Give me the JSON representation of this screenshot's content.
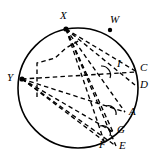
{
  "figure": {
    "type": "geometry-diagram",
    "background_color": "#ffffff",
    "stroke_color": "#000000",
    "circle": {
      "center_x": 78,
      "center_y": 88,
      "radius": 60,
      "solid_arc": true
    },
    "vertices": [
      {
        "id": "X",
        "label": "X",
        "x": 66,
        "y": 29,
        "label_x": 60,
        "label_y": 10,
        "dot": true
      },
      {
        "id": "Y",
        "label": "Y",
        "x": 22,
        "y": 79,
        "label_x": 7,
        "label_y": 72,
        "dot": true
      }
    ],
    "points": [
      {
        "id": "W",
        "label": "W",
        "x": 110,
        "y": 30,
        "label_x": 110,
        "label_y": 14,
        "dot": true
      },
      {
        "id": "C",
        "label": "C",
        "x": 137,
        "y": 72,
        "label_x": 140,
        "label_y": 62,
        "dot": false
      },
      {
        "id": "D",
        "label": "D",
        "x": 135,
        "y": 85,
        "label_x": 140,
        "label_y": 79,
        "dot": false
      },
      {
        "id": "A",
        "label": "A",
        "x": 125,
        "y": 112,
        "label_x": 129,
        "label_y": 106,
        "dot": false
      },
      {
        "id": "G",
        "label": "G",
        "x": 113,
        "y": 132,
        "label_x": 117,
        "label_y": 124,
        "dot": false
      },
      {
        "id": "E",
        "label": "E",
        "x": 116,
        "y": 146,
        "label_x": 119,
        "label_y": 140,
        "dot": false
      },
      {
        "id": "F",
        "label": "F",
        "x": 104,
        "y": 141,
        "label_x": 99,
        "label_y": 139,
        "dot": false
      },
      {
        "id": "I",
        "label": "I",
        "x": 114,
        "y": 69,
        "label_x": 117,
        "label_y": 58,
        "dot": false
      }
    ],
    "angle_marks": [
      {
        "id": "angle-at-I",
        "cx": 108,
        "cy": 72,
        "radius": 9
      },
      {
        "id": "angle-at-A",
        "cx": 113,
        "cy": 110,
        "radius": 8
      },
      {
        "id": "angle-at-G",
        "cx": 107,
        "cy": 130,
        "radius": 8
      }
    ]
  },
  "labels": {
    "X": "X",
    "Y": "Y",
    "W": "W",
    "C": "C",
    "D": "D",
    "A": "A",
    "G": "G",
    "E": "E",
    "F": "F",
    "I": "I"
  }
}
